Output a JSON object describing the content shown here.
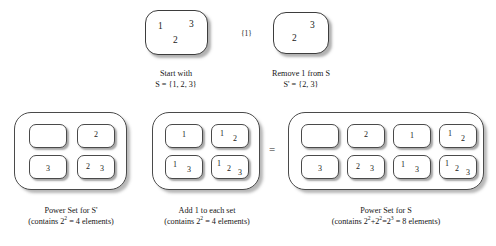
{
  "figure": {
    "equals_symbol": "=",
    "transform_label": "{1}"
  },
  "top": {
    "start": {
      "caption_line1": "Start with",
      "caption_line2": "S = {1, 2, 3}",
      "elements": [
        "1",
        "3",
        "2"
      ]
    },
    "removed": {
      "caption_line1": "Remove 1 from S",
      "caption_line2": "S' = {2, 3}",
      "elements": [
        "3",
        "2"
      ]
    }
  },
  "panels": {
    "power_set_s_prime": {
      "caption_line1": "Power Set for S'",
      "caption_line2_pre": "(contains 2",
      "caption_line2_sup": "2",
      "caption_line2_post": " = 4 elements)",
      "sets": [
        {
          "name": "empty-set",
          "members": []
        },
        {
          "name": "set-2",
          "members": [
            "2"
          ]
        },
        {
          "name": "set-3",
          "members": [
            "3"
          ]
        },
        {
          "name": "set-2-3",
          "members": [
            "2",
            "3"
          ]
        }
      ]
    },
    "add_one": {
      "caption_line1": "Add 1 to each set",
      "caption_line2_pre": "(contains 2",
      "caption_line2_sup": "2",
      "caption_line2_post": " = 4 elements)",
      "sets": [
        {
          "name": "set-1",
          "members": [
            "1"
          ]
        },
        {
          "name": "set-1-2",
          "members": [
            "1",
            "2"
          ]
        },
        {
          "name": "set-1-3",
          "members": [
            "1",
            "3"
          ]
        },
        {
          "name": "set-1-2-3",
          "members": [
            "1",
            "2",
            "3"
          ]
        }
      ]
    },
    "power_set_s": {
      "caption_line1": "Power Set for S",
      "caption_line2_pre": "(contains 2",
      "caption_line2_sup": "2",
      "caption_line2_mid": "+2",
      "caption_line2_sup2": "2",
      "caption_line2_mid2": "=2",
      "caption_line2_sup3": "3",
      "caption_line2_post": " = 8 elements)",
      "sets": [
        {
          "name": "empty-set",
          "members": []
        },
        {
          "name": "set-2",
          "members": [
            "2"
          ]
        },
        {
          "name": "set-1",
          "members": [
            "1"
          ]
        },
        {
          "name": "set-1-2",
          "members": [
            "1",
            "2"
          ]
        },
        {
          "name": "set-3",
          "members": [
            "3"
          ]
        },
        {
          "name": "set-2-3",
          "members": [
            "2",
            "3"
          ]
        },
        {
          "name": "set-1-3",
          "members": [
            "1",
            "3"
          ]
        },
        {
          "name": "set-1-2-3",
          "members": [
            "1",
            "2",
            "3"
          ]
        }
      ]
    }
  }
}
